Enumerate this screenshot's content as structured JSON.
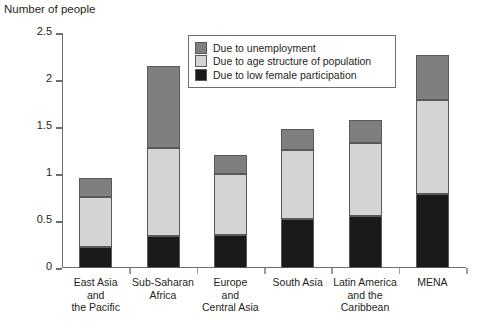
{
  "chart_data": {
    "type": "bar",
    "subtype": "stacked-vertical",
    "title": "Number of people",
    "xlabel": "",
    "ylabel": "Number of people",
    "ylim": [
      0,
      2.5
    ],
    "yticks": [
      "0",
      "0.5",
      "1",
      "1.5",
      "2",
      "2.5"
    ],
    "ytick_values": [
      0,
      0.5,
      1,
      1.5,
      2,
      2.5
    ],
    "grid": false,
    "legend_position": "top-center-inside",
    "categories": [
      "East Asia and the Pacific",
      "Sub-Saharan Africa",
      "Europe and Central Asia",
      "South Asia",
      "Latin America and the Caribbean",
      "MENA"
    ],
    "category_label_lines": [
      [
        "East Asia",
        "and",
        "the Pacific"
      ],
      [
        "Sub-Saharan",
        "Africa"
      ],
      [
        "Europe",
        "and",
        "Central Asia"
      ],
      [
        "South Asia"
      ],
      [
        "Latin America",
        "and the",
        "Caribbean"
      ],
      [
        "MENA"
      ]
    ],
    "series": [
      {
        "name": "Due to low female participation",
        "color": "#1a1a1a",
        "values": [
          0.22,
          0.34,
          0.35,
          0.52,
          0.55,
          0.79
        ]
      },
      {
        "name": "Due to age structure of population",
        "color": "#d4d4d2",
        "values": [
          0.54,
          0.94,
          0.65,
          0.74,
          0.78,
          1.0
        ]
      },
      {
        "name": "Due to unemployment",
        "color": "#7f7f7f",
        "values": [
          0.2,
          0.87,
          0.2,
          0.22,
          0.24,
          0.48
        ]
      }
    ],
    "totals": [
      0.96,
      2.15,
      1.2,
      1.48,
      1.57,
      2.27
    ],
    "cumulative_tops": [
      [
        0.22,
        0.76,
        0.96
      ],
      [
        0.34,
        1.28,
        2.15
      ],
      [
        0.35,
        1.0,
        1.2
      ],
      [
        0.52,
        1.26,
        1.48
      ],
      [
        0.55,
        1.33,
        1.57
      ],
      [
        0.79,
        1.79,
        2.27
      ]
    ]
  },
  "legend": {
    "items": [
      {
        "label": "Due to unemployment",
        "color": "#7f7f7f"
      },
      {
        "label": "Due to age structure of population",
        "color": "#d4d4d2"
      },
      {
        "label": "Due to low female participation",
        "color": "#1a1a1a"
      }
    ]
  },
  "colors": {
    "unemployment": "#7f7f7f",
    "age_structure": "#d4d4d2",
    "female_participation": "#1a1a1a",
    "axis": "#6d6e71",
    "text": "#231f20",
    "background": "#ffffff"
  }
}
